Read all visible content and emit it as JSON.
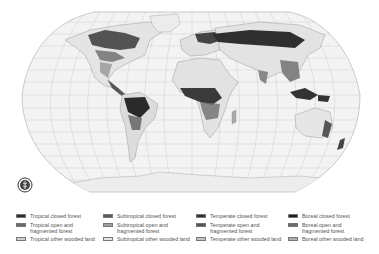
{
  "map": {
    "title": "World forest cover map",
    "projection": "Robinson",
    "colors": {
      "ocean": "#f2f2f2",
      "land": "#e8e8e8",
      "graticule": "#bdbdbd",
      "outline": "#aaaaaa",
      "closed_forest": "#2e2e2e",
      "open_forest": "#6e6e6e",
      "other_wooded": "#bcbcbc"
    }
  },
  "logo": {
    "name": "FAO"
  },
  "legend": {
    "columns": [
      {
        "zone": "Tropical",
        "items": [
          {
            "label": "Tropical closed forest",
            "color": "#2b2b2b"
          },
          {
            "label": "Tropical open and fragmented forest",
            "line1": "Tropical open and",
            "line2": "fragmented forest",
            "color": "#6a6a6a"
          },
          {
            "label": "Tropical other wooded land",
            "color": "#d0d0d0"
          }
        ]
      },
      {
        "zone": "Subtropical",
        "items": [
          {
            "label": "Subtropical closed forest",
            "color": "#5c5c5c"
          },
          {
            "label": "Subtropical open and fragmented forest",
            "line1": "Subtropical open and",
            "line2": "fragmented forest",
            "color": "#a0a0a0"
          },
          {
            "label": "Subtropical other wooded land",
            "color": "#e6e6e6"
          }
        ]
      },
      {
        "zone": "Temperate",
        "items": [
          {
            "label": "Temperate closed forest",
            "color": "#333333"
          },
          {
            "label": "Temperate open and fragmented forest",
            "line1": "Temperate open and",
            "line2": "fragmented forest",
            "color": "#555555"
          },
          {
            "label": "Temperate other wooded land",
            "color": "#c4c4c4"
          }
        ]
      },
      {
        "zone": "Boreal",
        "items": [
          {
            "label": "Boreal closed forest",
            "color": "#1f1f1f"
          },
          {
            "label": "Boreal open and fragmented forest",
            "line1": "Boreal open and",
            "line2": "fragmented forest",
            "color": "#6b6b6b"
          },
          {
            "label": "Boreal other wooded land",
            "color": "#b0b0b0"
          }
        ]
      }
    ]
  }
}
